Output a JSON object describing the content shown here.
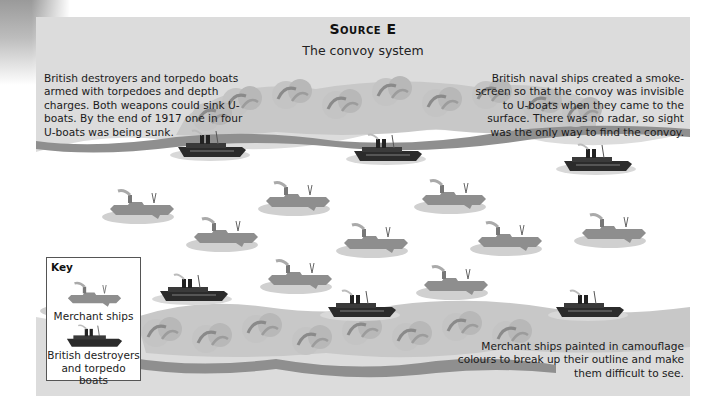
{
  "source": {
    "title": "Source E",
    "subtitle": "The convoy system"
  },
  "captions": {
    "top_left": "British destroyers and torpedo boats armed with torpedoes and depth charges. Both weapons could sink U-boats. By the end of 1917 one in four U-boats was being sunk.",
    "top_right": "British naval ships created a smoke-screen so that the convoy was invisible to U-boats when they came to the surface. There was no radar, so sight was the only way to find the convoy.",
    "bottom_right": "Merchant ships painted in camouflage colours to break up their outline and make them difficult to see."
  },
  "key": {
    "title": "Key",
    "items": [
      {
        "label": "Merchant ships",
        "icon": "merchant-ship-icon"
      },
      {
        "label": "British destroyers and torpedo boats",
        "icon": "destroyer-icon"
      }
    ]
  },
  "colors": {
    "panel_bg": "#dcdcdc",
    "sea": "#ffffff",
    "smoke_light": "#c8c8c8",
    "smoke_dark": "#9a9a9a",
    "merchant": "#8e8e8e",
    "destroyer": "#2b2b2b"
  }
}
